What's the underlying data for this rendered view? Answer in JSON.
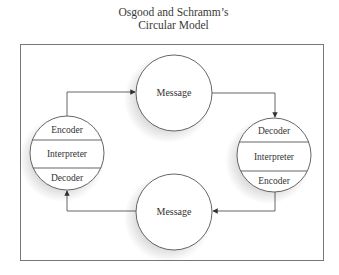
{
  "title": {
    "line1": "Osgood and Schramm’s",
    "line2": "Circular Model"
  },
  "nodes": {
    "top_message": {
      "label": "Message"
    },
    "bottom_message": {
      "label": "Message"
    },
    "left_person": {
      "sections": [
        "Encoder",
        "Interpreter",
        "Decoder"
      ]
    },
    "right_person": {
      "sections": [
        "Decoder",
        "Interpreter",
        "Encoder"
      ]
    }
  },
  "edges": [
    {
      "from": "left_person",
      "to": "top_message"
    },
    {
      "from": "top_message",
      "to": "right_person"
    },
    {
      "from": "right_person",
      "to": "bottom_message"
    },
    {
      "from": "bottom_message",
      "to": "left_person"
    }
  ],
  "colors": {
    "stroke": "#555555",
    "frame": "#777777",
    "text": "#333333",
    "fill": "#ffffff"
  }
}
